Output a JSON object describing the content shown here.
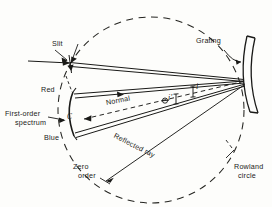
{
  "figure": {
    "type": "optical-ray-diagram",
    "background_color": "#fdfdfb",
    "ink_color": "#1a1a18"
  },
  "labels": {
    "slit": "Slit",
    "grating": "Grating",
    "red": "Red",
    "blue": "Blue",
    "point_c": "C",
    "first_order_spectrum_line1": "First-order",
    "first_order_spectrum_line2": "spectrum",
    "normal": "Normal",
    "reflected_ray": "Reflected  ray",
    "zero_order_line1": "Zero",
    "zero_order_line2": "order",
    "rowland_circle_line1": "Rowland",
    "rowland_circle_line2": "circle",
    "angle_incidence": "i",
    "angle_diffraction": "i'",
    "theta_symbol": "θ"
  },
  "geometry": {
    "circle_center_x": 151,
    "circle_center_y": 110,
    "circle_radius": 93,
    "circle_style": "dashed",
    "slit_point": [
      70,
      62
    ],
    "grating_point": [
      243,
      80
    ],
    "red_point": [
      73,
      94
    ],
    "c_point": [
      67,
      120
    ],
    "blue_point": [
      73,
      133
    ],
    "zero_order_point": [
      106,
      180
    ]
  }
}
